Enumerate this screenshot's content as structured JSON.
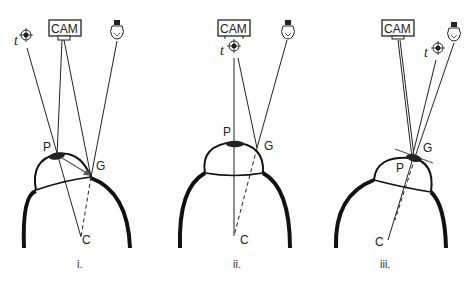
{
  "figure": {
    "panels": [
      {
        "id": "i",
        "caption": "i.",
        "labels": {
          "camera": "CAM",
          "target": "t",
          "pupil": "P",
          "glint": "G",
          "center": "C"
        },
        "icons": [
          "camera-icon",
          "target-icon",
          "light-bulb-icon"
        ]
      },
      {
        "id": "ii",
        "caption": "ii.",
        "labels": {
          "camera": "CAM",
          "target": "t",
          "pupil": "P",
          "glint": "G",
          "center": "C"
        },
        "icons": [
          "camera-icon",
          "target-icon",
          "light-bulb-icon"
        ]
      },
      {
        "id": "iii",
        "caption": "iii.",
        "labels": {
          "camera": "CAM",
          "target": "t",
          "pupil": "P",
          "glint": "G",
          "center": "C"
        },
        "icons": [
          "camera-icon",
          "target-icon",
          "light-bulb-icon"
        ]
      }
    ],
    "colors": {
      "line": "#222222",
      "eye_outline": "#111111",
      "vector": "#555555",
      "background": "#ffffff"
    }
  }
}
